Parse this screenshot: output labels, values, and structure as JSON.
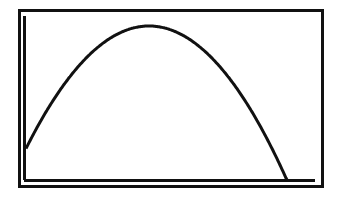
{
  "colors": {
    "background": "#ffffff",
    "ink": "#111111"
  },
  "chart_data": {
    "type": "line",
    "title": "",
    "xlabel": "",
    "ylabel": "",
    "grid": false,
    "legend": null,
    "axes": {
      "x_axis_at_bottom": true,
      "y_axis_at_left": true,
      "tick_labels": false
    },
    "xlim": [
      0,
      10
    ],
    "ylim": [
      0,
      10
    ],
    "series": [
      {
        "name": "parabola",
        "shape": "downward-opening parabola",
        "x": [
          0.07,
          0.5,
          1.0,
          1.5,
          2.0,
          2.5,
          3.0,
          3.5,
          4.0,
          4.5,
          5.0,
          5.5,
          6.0,
          6.5,
          7.0,
          7.5,
          8.0,
          8.5,
          8.95
        ],
        "values": [
          1.95,
          3.8,
          5.5,
          6.9,
          8.0,
          8.9,
          9.5,
          9.9,
          10.0,
          9.9,
          9.6,
          9.0,
          8.3,
          7.4,
          6.2,
          4.9,
          3.4,
          1.7,
          0.0
        ]
      }
    ],
    "vertex": {
      "x": 4.05,
      "y": 10.0
    },
    "pixel_geometry": {
      "frame": {
        "left": 19,
        "top": 10,
        "right": 322,
        "bottom": 186
      },
      "y_axis_x": 24,
      "x_axis_y": 180,
      "plot_right": 315,
      "curve": {
        "vertex_x": 149,
        "vertex_y": 26,
        "a": 0.0081,
        "x_start": 26,
        "x_end": 287
      }
    }
  }
}
